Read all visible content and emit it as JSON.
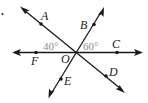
{
  "diagram": {
    "type": "geometry-lines-through-point",
    "problem_marker": ".",
    "center": {
      "label": "O",
      "x": 76,
      "y": 52
    },
    "points": [
      {
        "id": "A",
        "label": "A",
        "x": 41,
        "y": 24
      },
      {
        "id": "B",
        "label": "B",
        "x": 94,
        "y": 24
      },
      {
        "id": "C",
        "label": "C",
        "x": 117,
        "y": 52
      },
      {
        "id": "D",
        "label": "D",
        "x": 106,
        "y": 76
      },
      {
        "id": "E",
        "label": "E",
        "x": 61,
        "y": 79
      },
      {
        "id": "F",
        "label": "F",
        "x": 36,
        "y": 52
      }
    ],
    "lines": [
      {
        "name": "line-FC",
        "from": "F",
        "to": "C"
      },
      {
        "name": "line-AD",
        "from": "A",
        "to": "D"
      },
      {
        "name": "line-BE",
        "from": "B",
        "to": "E"
      }
    ],
    "angles": [
      {
        "label": "40°",
        "between": [
          "OA",
          "OF"
        ]
      },
      {
        "label": "60°",
        "between": [
          "OB",
          "OC"
        ]
      }
    ],
    "colors": {
      "line": "#1a1a1a",
      "angle_text": "#8a8a8a"
    }
  }
}
